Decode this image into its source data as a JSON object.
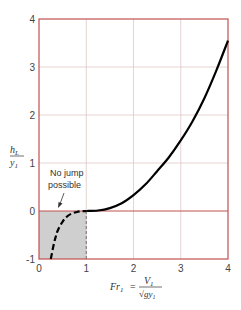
{
  "chart_data": {
    "type": "line",
    "title": "",
    "xlabel": "Fr₁ = V₁ / √(g y₁)",
    "ylabel": "h_L / y₁",
    "xlim": [
      0,
      4
    ],
    "ylim": [
      -1,
      4
    ],
    "x_ticks": [
      "0",
      "1",
      "2",
      "3",
      "4"
    ],
    "y_ticks": [
      "-1",
      "0",
      "1",
      "2",
      "3",
      "4"
    ],
    "grid": true,
    "legend": null,
    "series": [
      {
        "name": "Physical (hydraulic jump)",
        "style": "solid",
        "x": [
          1.0,
          1.25,
          1.5,
          1.75,
          2.0,
          2.25,
          2.5,
          2.75,
          3.0,
          3.25,
          3.5,
          3.75,
          4.0
        ],
        "y": [
          0.0,
          0.01,
          0.06,
          0.16,
          0.33,
          0.55,
          0.83,
          1.12,
          1.47,
          1.87,
          2.35,
          2.92,
          3.55
        ]
      },
      {
        "name": "Non-physical (no jump)",
        "style": "dashed",
        "x": [
          0.25,
          0.3,
          0.35,
          0.4,
          0.5,
          0.6,
          0.7,
          0.8,
          0.9,
          1.0
        ],
        "y": [
          -1.0,
          -0.75,
          -0.55,
          -0.4,
          -0.22,
          -0.11,
          -0.05,
          -0.02,
          -0.005,
          0.0
        ]
      }
    ],
    "shaded_region": {
      "x": [
        0,
        1
      ],
      "y": [
        -1,
        0
      ],
      "color": "#cfcfcf"
    },
    "annotations": [
      {
        "text_line1": "No jump",
        "text_line2": "possible",
        "arrow_to": [
          0.45,
          0.0
        ]
      }
    ],
    "colors": {
      "axes": "#c0504d",
      "grid": "#e0c8c8",
      "curve": "#000000"
    }
  },
  "labels": {
    "ylabel_num": "h",
    "ylabel_num_sub": "L",
    "ylabel_den": "y",
    "ylabel_den_sub": "1",
    "xlabel_lhs": "Fr",
    "xlabel_lhs_sub": "1",
    "xlabel_eq": "=",
    "xlabel_num": "V",
    "xlabel_num_sub": "1",
    "xlabel_den": "√gy",
    "xlabel_den_sub": "1",
    "annot_line1": "No jump",
    "annot_line2": "possible"
  }
}
